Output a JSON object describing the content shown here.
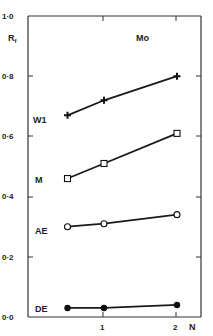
{
  "chart_data": {
    "type": "line",
    "title": "Mo",
    "xlabel": "N",
    "ylabel": "Rf",
    "ylim": [
      0.0,
      1.0
    ],
    "y_ticks": [
      "0·0",
      "0·2",
      "0·4",
      "0·6",
      "0·8",
      "1·0"
    ],
    "x_ticks": [
      "1",
      "2"
    ],
    "grid": false,
    "x": [
      0.5,
      1,
      2
    ],
    "series": [
      {
        "name": "W1",
        "marker": "plus",
        "values": [
          0.67,
          0.72,
          0.8
        ]
      },
      {
        "name": "M",
        "marker": "open-square",
        "values": [
          0.46,
          0.51,
          0.61
        ]
      },
      {
        "name": "AE",
        "marker": "open-circle",
        "values": [
          0.3,
          0.31,
          0.34
        ]
      },
      {
        "name": "DE",
        "marker": "filled-circle",
        "values": [
          0.03,
          0.03,
          0.04
        ]
      }
    ]
  },
  "labels": {
    "title": "Mo",
    "ylabel_main": "R",
    "ylabel_sub": "f",
    "xlabel": "N",
    "y_ticks": [
      "0·0",
      "0·2",
      "0·4",
      "0·6",
      "0·8",
      "1·0"
    ],
    "x_ticks": [
      "1",
      "2"
    ],
    "series_names": [
      "W1",
      "M",
      "AE",
      "DE"
    ]
  }
}
